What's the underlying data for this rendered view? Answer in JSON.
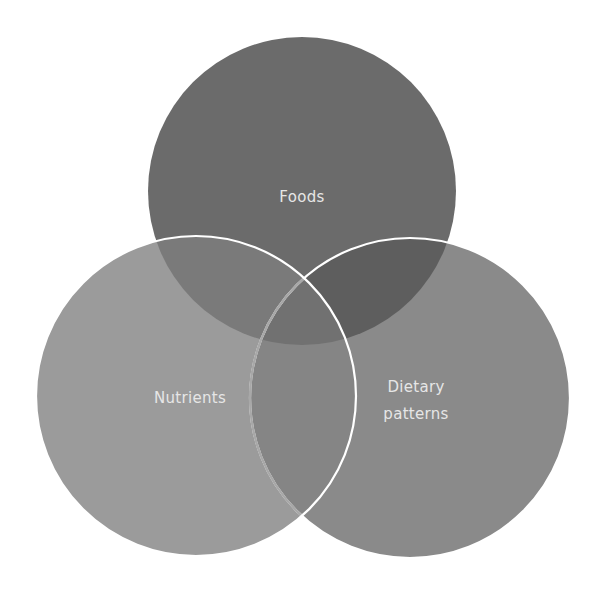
{
  "diagram": {
    "type": "venn",
    "sets": [
      {
        "id": "foods",
        "label": "Foods",
        "lines": [
          "Foods"
        ],
        "color": "#6b6b6b"
      },
      {
        "id": "nutrients",
        "label": "Nutrients",
        "lines": [
          "Nutrients"
        ],
        "color": "#9b9b9b"
      },
      {
        "id": "dietary-patterns",
        "label": "Dietary patterns",
        "lines": [
          "Dietary",
          "patterns"
        ],
        "color": "#8a8a8a"
      }
    ],
    "overlap_colors": {
      "foods_nutrients": "#7a7a7a",
      "foods_dietary": "#5e5e5e",
      "nutrients_dietary": "#858585",
      "all_three": "#717171"
    },
    "outline_color": "#ffffff",
    "text_color": "#e6e6e6",
    "background": "#ffffff"
  }
}
